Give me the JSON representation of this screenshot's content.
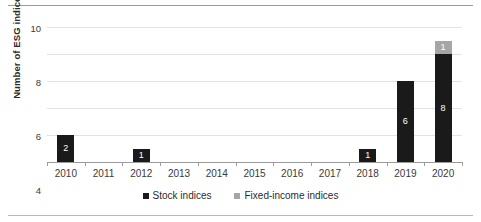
{
  "chart_data": {
    "type": "bar",
    "stacked": true,
    "title": "",
    "xlabel": "",
    "ylabel": "Number of ESG indices",
    "categories": [
      "2010",
      "2011",
      "2012",
      "2013",
      "2014",
      "2015",
      "2016",
      "2017",
      "2018",
      "2019",
      "2020"
    ],
    "series": [
      {
        "name": "Stock indices",
        "color": "#1a1a1a",
        "values": [
          2,
          0,
          1,
          0,
          0,
          0,
          0,
          0,
          1,
          6,
          8
        ],
        "labels": [
          "2",
          "",
          "1",
          "",
          "",
          "",
          "",
          "",
          "1",
          "6",
          "8"
        ]
      },
      {
        "name": "Fixed-income indices",
        "color": "#a6a6a6",
        "values": [
          0,
          0,
          0,
          0,
          0,
          0,
          0,
          0,
          0,
          0,
          1
        ],
        "labels": [
          "",
          "",
          "",
          "",
          "",
          "",
          "",
          "",
          "",
          "",
          "1"
        ]
      }
    ],
    "ylim": [
      0,
      10
    ],
    "yticks": [
      "0",
      "2",
      "4",
      "6",
      "8",
      "10"
    ],
    "ytick_values": [
      0,
      2,
      4,
      6,
      8,
      10
    ],
    "grid": true,
    "legend_position": "bottom"
  },
  "legend": {
    "items": [
      {
        "label": "Stock indices",
        "color": "#1a1a1a"
      },
      {
        "label": "Fixed-income indices",
        "color": "#a6a6a6"
      }
    ]
  },
  "axis": {
    "y_title": "Number of ESG indices"
  }
}
